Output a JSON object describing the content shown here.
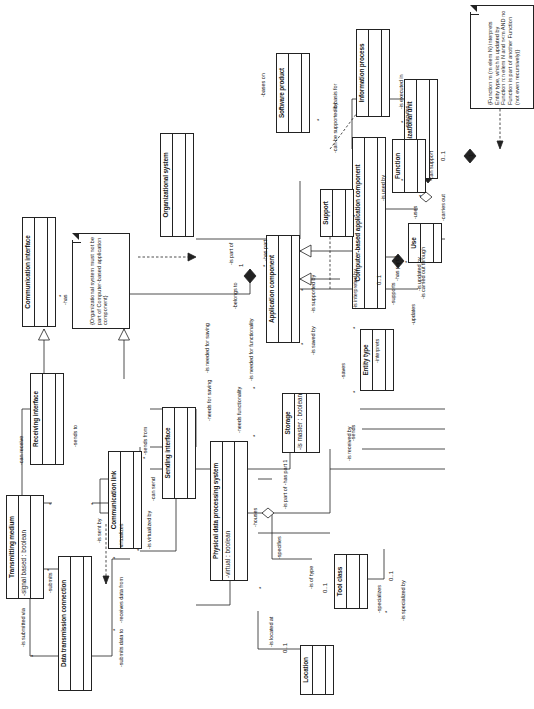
{
  "diagram": {
    "kind": "uml-class-diagram",
    "orientation": "rotated-90-ccw",
    "classes": [
      {
        "id": "data-transmission-connection",
        "name": "Data transmission connection",
        "attributes": "",
        "operations": ""
      },
      {
        "id": "transmitting-medium",
        "name": "Transmitting medium",
        "attributes": "-signal based : boolean",
        "operations": ""
      },
      {
        "id": "receiving-interface",
        "name": "Receiving interface",
        "attributes": "",
        "operations": ""
      },
      {
        "id": "communication-interface",
        "name": "Communication interface",
        "attributes": "",
        "operations": ""
      },
      {
        "id": "communication-link",
        "name": "Communication link",
        "attributes": "",
        "operations": ""
      },
      {
        "id": "sending-interface",
        "name": "Sending interface",
        "attributes": "",
        "operations": ""
      },
      {
        "id": "physical-data-processing-system",
        "name": "Physical data processing system",
        "attributes": "-virtual : boolean",
        "operations": ""
      },
      {
        "id": "organizational-system",
        "name": "Organizational system",
        "attributes": "",
        "operations": ""
      },
      {
        "id": "application-component",
        "name": "Application component",
        "attributes": "",
        "operations": ""
      },
      {
        "id": "computer-based-application-component",
        "name": "Computer-based application component",
        "attributes": "",
        "operations": ""
      },
      {
        "id": "location",
        "name": "Location",
        "attributes": "",
        "operations": ""
      },
      {
        "id": "tool-class",
        "name": "Tool class",
        "attributes": "",
        "operations": ""
      },
      {
        "id": "storage",
        "name": "Storage",
        "attributes": "-is master : boolean",
        "operations": ""
      },
      {
        "id": "support",
        "name": "Support",
        "attributes": "",
        "operations": ""
      },
      {
        "id": "use",
        "name": "Use",
        "attributes": "",
        "operations": ""
      },
      {
        "id": "organizational-unit",
        "name": "Organizational unit",
        "attributes": "",
        "operations": ""
      },
      {
        "id": "entity-type",
        "name": "Entity type",
        "attributes": "",
        "operations": ""
      },
      {
        "id": "function",
        "name": "Function",
        "attributes": "",
        "operations": ""
      },
      {
        "id": "information-process",
        "name": "Information process",
        "attributes": "",
        "operations": ""
      },
      {
        "id": "software-product",
        "name": "Software product",
        "attributes": "",
        "operations": ""
      }
    ],
    "notes": [
      {
        "id": "note-org-system",
        "text": "{Organizational system must not be part of Computer-based application component}"
      },
      {
        "id": "note-function",
        "text": "{Function m (m elem N) interprets Entity type, which is updated by Function n:n elem N and n<m AND no Function is part of another Function (not even recursively)}"
      }
    ],
    "association_labels": [
      "-is submitted via",
      "-submits",
      "-receives data from",
      "-submits data to",
      "-virtualizes",
      "-is virtualized by",
      "-can receive",
      "-sends to",
      "-is sent by",
      "-sends from",
      "-can send",
      "-has",
      "-belongs to",
      "-is part of",
      "-has part",
      "-houses",
      "-is located at",
      "-specifies",
      "-is of type",
      "-specializes",
      "-is specialized by",
      "-needs functionality",
      "-needs for saving",
      "-is needed for functionality",
      "-is needed for saving",
      "-is saved by",
      "-is supported by",
      "-supports",
      "-uses",
      "-is used by",
      "-is carried out through",
      "-carries out",
      "-is basis for",
      "-bases on",
      "-can be supported by",
      "-can support",
      "-sends",
      "-is received by",
      "-saves",
      "-interprets",
      "-is interpreted by",
      "-updates",
      "-is updated by",
      "-executes",
      "-is executed in",
      "-has part 1",
      "-is part of -has part 1"
    ],
    "multiplicities": [
      "*",
      "1",
      "0..1"
    ]
  }
}
